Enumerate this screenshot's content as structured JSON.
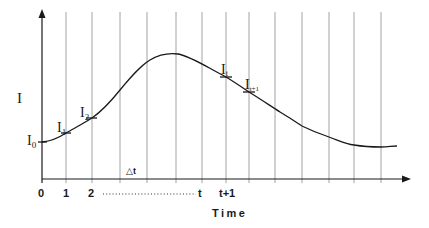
{
  "diagram": {
    "y_axis_label": "I",
    "x_axis_label": "Time",
    "delta_label": "△t",
    "tick_labels": [
      "0",
      "1",
      "2",
      "t",
      "t+1"
    ],
    "point_labels": [
      {
        "main": "I",
        "sub": "0"
      },
      {
        "main": "I",
        "sub": "1"
      },
      {
        "main": "I",
        "sub": "2"
      },
      {
        "main": "I",
        "sub": "t"
      },
      {
        "main": "I",
        "sub": "t+1"
      }
    ],
    "grid_x": [
      66,
      92,
      120,
      147,
      176,
      202,
      226,
      249,
      275,
      302,
      329,
      354,
      381
    ],
    "colors": {
      "ink": "#1a1a1a",
      "grid": "#8a8a8a",
      "background": "#ffffff"
    }
  }
}
